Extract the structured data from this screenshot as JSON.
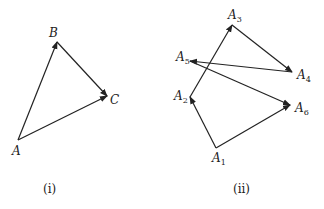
{
  "figures": [
    {
      "caption": "(i)",
      "points": {
        "A": {
          "label": "A",
          "x": 18,
          "y": 140
        },
        "B": {
          "label": "B",
          "x": 57,
          "y": 42
        },
        "C": {
          "label": "C",
          "x": 107,
          "y": 96
        }
      },
      "vectors": [
        [
          "A",
          "B"
        ],
        [
          "B",
          "C"
        ],
        [
          "A",
          "C"
        ]
      ]
    },
    {
      "caption": "(ii)",
      "points": {
        "A1": {
          "label": "A",
          "sub": "1",
          "x": 216,
          "y": 148
        },
        "A2": {
          "label": "A",
          "sub": "2",
          "x": 190,
          "y": 97
        },
        "A3": {
          "label": "A",
          "sub": "3",
          "x": 232,
          "y": 25
        },
        "A4": {
          "label": "A",
          "sub": "4",
          "x": 292,
          "y": 72
        },
        "A5": {
          "label": "A",
          "sub": "5",
          "x": 190,
          "y": 61
        },
        "A6": {
          "label": "A",
          "sub": "6",
          "x": 290,
          "y": 105
        }
      },
      "vectors": [
        [
          "A1",
          "A2"
        ],
        [
          "A2",
          "A3"
        ],
        [
          "A3",
          "A4"
        ],
        [
          "A4",
          "A5"
        ],
        [
          "A5",
          "A6"
        ],
        [
          "A1",
          "A6"
        ]
      ]
    }
  ],
  "colors": {
    "stroke": "#222222",
    "background": "#ffffff"
  }
}
